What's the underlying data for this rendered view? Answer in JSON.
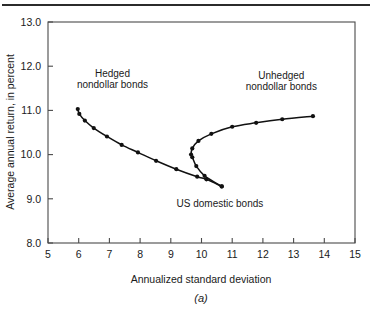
{
  "figure": {
    "caption": "(a)",
    "top_rule": true
  },
  "chart_data": {
    "type": "line",
    "title": "",
    "subtitle": "",
    "xlabel": "Annualized standard deviation",
    "ylabel": "Average annual return, in percent",
    "xlim": [
      5,
      15
    ],
    "ylim": [
      8.0,
      13.0
    ],
    "xticks": [
      5,
      6,
      7,
      8,
      9,
      10,
      11,
      12,
      13,
      14,
      15
    ],
    "xtick_labels": [
      "5",
      "6",
      "7",
      "8",
      "9",
      "10",
      "11",
      "12",
      "13",
      "14",
      "15"
    ],
    "yticks": [
      8.0,
      9.0,
      10.0,
      11.0,
      12.0,
      13.0
    ],
    "ytick_labels": [
      "8.0",
      "9.0",
      "10.0",
      "11.0",
      "12.0",
      "13.0"
    ],
    "grid": false,
    "legend": "none",
    "marker": "filled-circle",
    "line_color": "#111111",
    "marker_color": "#111111",
    "annotations": [
      {
        "name": "hedged-nondollar-bonds",
        "text_lines": [
          "Hedged",
          "nondollar bonds"
        ],
        "x": 7.1,
        "y": 11.75
      },
      {
        "name": "unhedged-nondollar-bonds",
        "text_lines": [
          "Unhedged",
          "nondollar bonds"
        ],
        "x": 12.6,
        "y": 11.72
      },
      {
        "name": "us-domestic-bonds",
        "text_lines": [
          "US domestic bonds"
        ],
        "x": 10.6,
        "y": 8.82
      }
    ],
    "series": [
      {
        "name": "Efficient frontier (hedged lower branch)",
        "points": [
          [
            5.97,
            11.03
          ],
          [
            6.02,
            10.92
          ],
          [
            6.2,
            10.77
          ],
          [
            6.49,
            10.6
          ],
          [
            6.92,
            10.41
          ],
          [
            7.4,
            10.22
          ],
          [
            7.93,
            10.05
          ],
          [
            8.52,
            9.86
          ],
          [
            9.18,
            9.67
          ],
          [
            9.86,
            9.5
          ],
          [
            10.16,
            9.44
          ],
          [
            10.66,
            9.28
          ]
        ]
      },
      {
        "name": "Efficient frontier (unhedged upper branch)",
        "points": [
          [
            10.66,
            9.28
          ],
          [
            10.1,
            9.52
          ],
          [
            9.83,
            9.74
          ],
          [
            9.7,
            9.94
          ],
          [
            9.66,
            10.0
          ],
          [
            9.7,
            10.14
          ],
          [
            9.9,
            10.31
          ],
          [
            10.32,
            10.47
          ],
          [
            11.0,
            10.63
          ],
          [
            11.78,
            10.72
          ],
          [
            12.63,
            10.8
          ],
          [
            13.63,
            10.87
          ]
        ]
      }
    ]
  }
}
